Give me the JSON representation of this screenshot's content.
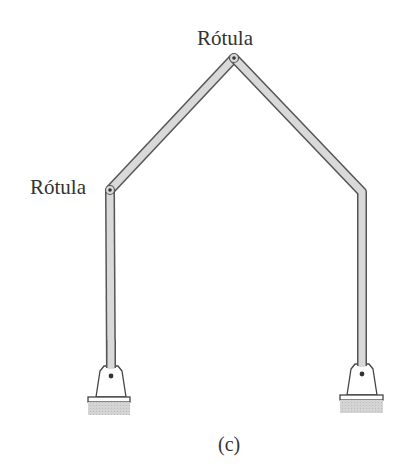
{
  "diagram": {
    "type": "three-hinged gable frame",
    "labels": {
      "top_hinge": "Rótula",
      "left_hinge": "Rótula",
      "caption": "(c)"
    },
    "colors": {
      "member_fill": "#d9d9d9",
      "member_outline": "#555555",
      "text": "#333333",
      "ground": "#d0d0d0",
      "pin": "#333333"
    },
    "nodes": {
      "left_base_pin": [
        111,
        376
      ],
      "left_hinge": [
        110,
        190
      ],
      "apex_hinge": [
        234,
        58
      ],
      "right_knee": [
        362,
        192
      ],
      "right_base_pin": [
        362,
        374
      ]
    },
    "supports": [
      {
        "name": "left-support",
        "type": "pinned",
        "x": 111,
        "plate_y": 397
      },
      {
        "name": "right-support",
        "type": "pinned",
        "x": 362,
        "plate_y": 395
      }
    ]
  }
}
